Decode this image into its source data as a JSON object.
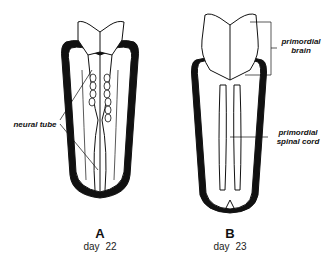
{
  "figure": {
    "panels": [
      {
        "id": "A",
        "letter": "A",
        "caption": "day 22",
        "labels": [
          "neural tube"
        ]
      },
      {
        "id": "B",
        "letter": "B",
        "caption": "day 23",
        "labels": [
          "primordial brain",
          "primordial spinal cord"
        ]
      }
    ]
  },
  "labels": {
    "neural_tube": "neural tube",
    "primordial_brain_1": "primordial",
    "primordial_brain_2": "brain",
    "spinal_cord_1": "primordial",
    "spinal_cord_2": "spinal cord"
  },
  "captions": {
    "a_letter": "A",
    "a_day": "day 22",
    "b_letter": "B",
    "b_day": "day 23"
  }
}
